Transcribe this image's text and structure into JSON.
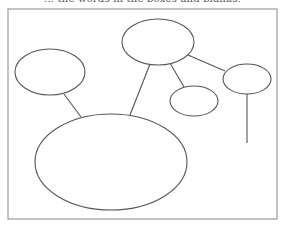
{
  "header": {
    "instruction_text": "... the words in the boxes and blanks."
  },
  "diagram": {
    "type": "web-organizer",
    "frame": {
      "x": 8,
      "y": 9,
      "width": 269,
      "height": 210,
      "stroke": "#9a9a9a"
    },
    "stroke_color": "#555555",
    "ellipses": [
      {
        "id": "top-center",
        "cx": 158,
        "cy": 42,
        "rx": 36,
        "ry": 23,
        "label": ""
      },
      {
        "id": "left",
        "cx": 50,
        "cy": 72,
        "rx": 35,
        "ry": 23,
        "label": ""
      },
      {
        "id": "small-center-right",
        "cx": 194,
        "cy": 101,
        "rx": 24,
        "ry": 15,
        "label": ""
      },
      {
        "id": "right",
        "cx": 247,
        "cy": 79,
        "rx": 24,
        "ry": 15,
        "label": ""
      },
      {
        "id": "big-bottom",
        "cx": 111,
        "cy": 162,
        "rx": 76,
        "ry": 48,
        "label": ""
      }
    ],
    "connectors": [
      {
        "from": "left",
        "to": "big-bottom",
        "x1": 64,
        "y1": 94,
        "x2": 81,
        "y2": 117
      },
      {
        "from": "top-center",
        "to": "big-bottom",
        "x1": 150,
        "y1": 64,
        "x2": 130,
        "y2": 115
      },
      {
        "from": "top-center",
        "to": "small-center-right",
        "x1": 170,
        "y1": 63,
        "x2": 184,
        "y2": 87
      },
      {
        "from": "top-center",
        "to": "right",
        "x1": 188,
        "y1": 55,
        "x2": 225,
        "y2": 71
      },
      {
        "from": "right",
        "to": "open-end",
        "x1": 247,
        "y1": 94,
        "x2": 247,
        "y2": 143
      }
    ]
  }
}
